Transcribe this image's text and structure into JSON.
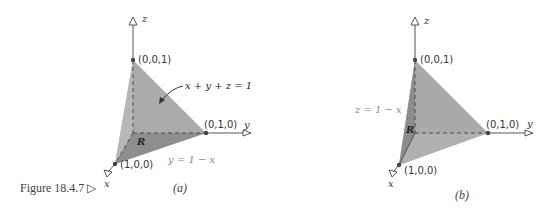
{
  "figure": {
    "caption": "Figure 18.4.7 ▷",
    "colors": {
      "face_light": "#b3b3b3",
      "face_mid": "#a3a3a3",
      "face_dark": "#8f8f8f",
      "axis": "#555555",
      "point": "#444444"
    }
  },
  "panel_a": {
    "label": "(a)",
    "axes": {
      "x": "x",
      "y": "y",
      "z": "z"
    },
    "points": {
      "top": "(0,0,1)",
      "right": "(0,1,0)",
      "bottom": "(1,0,0)"
    },
    "plane_label": "x + y + z = 1",
    "region_label": "R",
    "boundary_label": "y = 1 − x"
  },
  "panel_b": {
    "label": "(b)",
    "axes": {
      "x": "x",
      "y": "y",
      "z": "z"
    },
    "points": {
      "top": "(0,0,1)",
      "right": "(0,1,0)",
      "bottom": "(1,0,0)"
    },
    "region_label": "R",
    "boundary_label": "z = 1 − x"
  }
}
